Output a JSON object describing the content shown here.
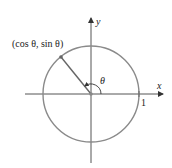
{
  "diagram": {
    "point_label": "(cos θ, sin θ)",
    "angle_label": "θ",
    "x_axis_label": "x",
    "y_axis_label": "y",
    "radius_tick_label": "1",
    "colors": {
      "circle": "#8a8a8a",
      "axes": "#555555",
      "radius": "#666666",
      "text": "#222222"
    }
  }
}
